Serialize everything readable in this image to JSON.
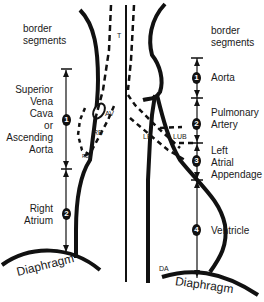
{
  "left_panel": {
    "heading": [
      "border",
      "segments"
    ],
    "segments": [
      {
        "number": "1",
        "label": [
          "Superior",
          "Vena",
          "Cava",
          "or",
          "Ascending",
          "Aorta"
        ]
      },
      {
        "number": "2",
        "label": [
          "Right",
          "Atrium"
        ]
      }
    ],
    "diaphragm": "Diaphragm"
  },
  "right_panel": {
    "heading": [
      "border",
      "segments"
    ],
    "segments": [
      {
        "number": "1",
        "label": [
          "Aorta"
        ]
      },
      {
        "number": "2",
        "label": [
          "Pulmonary",
          "Artery"
        ]
      },
      {
        "number": "3",
        "label": [
          "Left",
          "Atrial",
          "Appendage"
        ]
      },
      {
        "number": "4",
        "label": [
          "Ventricle"
        ]
      }
    ],
    "diaphragm": "Diaphragm"
  },
  "anatomy_labels": {
    "trachea": "T",
    "azygos_vein": "AV",
    "right_bronchus": "RB",
    "left_bronchus": "LB",
    "left_upper_bronchus": "LUB",
    "right_lower_bronchus": "RBL",
    "descending_aorta": "DA"
  }
}
